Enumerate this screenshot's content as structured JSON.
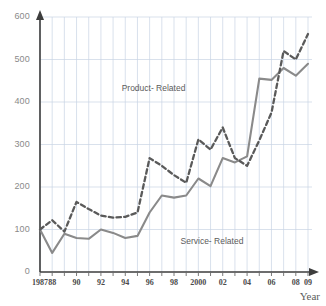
{
  "chart_data": {
    "type": "line",
    "title": "",
    "xlabel": "Year",
    "ylabel": "",
    "ylim": [
      0,
      600
    ],
    "yticks": [
      0,
      100,
      200,
      300,
      400,
      500,
      600
    ],
    "ytick_labels": [
      "0",
      "100",
      "200",
      "300",
      "400",
      "500",
      "600"
    ],
    "grid": true,
    "grid_color": "#c9d4e4",
    "legend_position": "inline-annotation",
    "x": [
      1987,
      1988,
      1989,
      1990,
      1991,
      1992,
      1993,
      1994,
      1995,
      1996,
      1997,
      1998,
      1999,
      2000,
      2001,
      2002,
      2003,
      2004,
      2005,
      2006,
      2007,
      2008,
      2009
    ],
    "xtick_labels": [
      "1987",
      "88",
      "",
      "90",
      "",
      "92",
      "",
      "94",
      "",
      "96",
      "",
      "98",
      "",
      "2000",
      "",
      "02",
      "",
      "04",
      "",
      "06",
      "",
      "08",
      "09"
    ],
    "series": [
      {
        "name": "Product- Related",
        "style": "dashed",
        "color": "#5a5a5a",
        "values": [
          100,
          122,
          95,
          165,
          148,
          133,
          128,
          130,
          140,
          268,
          250,
          228,
          210,
          312,
          288,
          340,
          268,
          250,
          310,
          375,
          520,
          500,
          560
        ]
      },
      {
        "name": "Service- Related",
        "style": "solid",
        "color": "#8a8a8a",
        "values": [
          100,
          45,
          90,
          80,
          78,
          100,
          92,
          80,
          85,
          140,
          180,
          175,
          180,
          220,
          202,
          268,
          258,
          272,
          455,
          452,
          480,
          462,
          490
        ]
      }
    ],
    "annotations": [
      {
        "text": "Product- Related",
        "x": 1996,
        "y": 430
      },
      {
        "text": "Service- Related",
        "x": 2001,
        "y": 70
      }
    ]
  },
  "axes": {
    "x_title": "Year",
    "y_title": ""
  }
}
